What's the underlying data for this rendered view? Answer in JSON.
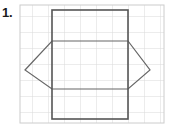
{
  "worksheet": {
    "problem_number": "1.",
    "title": "Rectangle and hexagon on grid"
  },
  "colors": {
    "grid_line": "#d9d9d9",
    "grid_border": "#cccccc",
    "rectangle_stroke": "#555555",
    "hexagon_stroke": "#666666",
    "label_text": "#1a1a1a",
    "background": "#ffffff"
  },
  "grid": {
    "name": "square-grid",
    "x": 20,
    "y": 5,
    "columns": 9,
    "rows": 7,
    "cell_size": 16,
    "width": 144,
    "height": 118
  },
  "shapes": [
    {
      "name": "rectangle",
      "type": "rectangle",
      "x": 52,
      "y": 10,
      "width": 76,
      "height": 109,
      "stroke_width": 1.6
    },
    {
      "name": "hexagon",
      "type": "hexagon",
      "points": "52,41 128,41 150,70 128,89 52,89 25,70",
      "stroke_width": 1.2
    }
  ]
}
